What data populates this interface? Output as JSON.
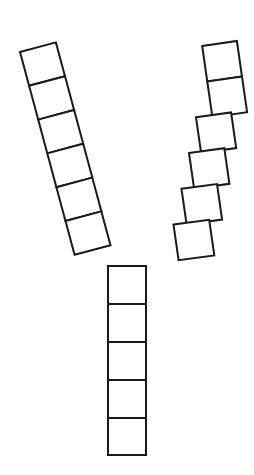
{
  "figure": {
    "background_color": "#ffffff",
    "stroke_color": "#1a1a1a",
    "fill_color": "#ffffff",
    "stroke_width": 2,
    "canvas": {
      "width": 254,
      "height": 475
    },
    "shape_name": "Y-shape",
    "total_cells": 17,
    "junction_point": {
      "x": 127,
      "y": 253
    },
    "branches": [
      {
        "name": "left-branch",
        "cell_count": 6,
        "orientation": "diagonal-up-left",
        "angle_degrees": -74,
        "cell_width": 38,
        "cell_length": 35,
        "start": {
          "x": 20,
          "y": 52
        },
        "end": {
          "x": 127,
          "y": 253
        },
        "cell_labels": [
          "L1",
          "L2",
          "L3",
          "L4",
          "L5",
          "L6"
        ]
      },
      {
        "name": "right-branch",
        "cell_count": 6,
        "orientation": "diagonal-up-right",
        "angle_degrees": -99,
        "cell_width": 35,
        "cell_length": 36,
        "start": {
          "x": 219,
          "y": 43
        },
        "end": {
          "x": 140,
          "y": 253
        },
        "cell_labels": [
          "R1",
          "R2",
          "R3",
          "R4",
          "R5",
          "R6"
        ]
      },
      {
        "name": "stem-branch",
        "cell_count": 5,
        "orientation": "vertical",
        "angle_degrees": 90,
        "cell_width": 38,
        "cell_length": 38,
        "start": {
          "x": 108,
          "y": 266
        },
        "end": {
          "x": 146,
          "y": 455
        },
        "cell_labels": [
          "S1",
          "S2",
          "S3",
          "S4",
          "S5"
        ]
      }
    ],
    "geometry": {
      "left_cells": [
        "20.0,52.0 55.9,42.4 65.0,76.2 29.1,85.8",
        "29.1,85.8 65.0,76.2 74.1,110.0 38.2,119.6",
        "38.2,119.6 74.1,110.0 83.2,143.8 47.3,153.4",
        "47.3,153.4 83.2,143.8 92.3,177.6 56.4,187.2",
        "56.4,187.2 92.3,177.6 101.4,211.4 65.5,221.0",
        "65.5,221.0 101.4,211.4 110.5,245.2 74.6,254.8"
      ],
      "right_cells": [
        "202.2,46.0 236.9,41.0 242.0,76.6 207.3,81.6",
        "207.3,81.6 242.0,76.6 247.1,112.2 212.4,117.2",
        "196.0,117.3 231.1,112.5 236.2,148.1 201.1,152.9",
        "189.0,153.0 224.3,148.2 229.4,183.8 194.1,188.6",
        "181.5,188.8 217.0,184.0 222.1,219.6 186.6,224.4",
        "173.5,224.6 209.2,219.8 214.3,255.4 178.6,260.2"
      ],
      "stem_cells": [
        "108,266 146,266 146,304 108,304",
        "108,304 146,304 146,342 108,342",
        "108,342 146,342 146,380 108,380",
        "108,380 146,380 146,418 108,418",
        "108,418 146,418 146,455 108,455"
      ]
    }
  }
}
